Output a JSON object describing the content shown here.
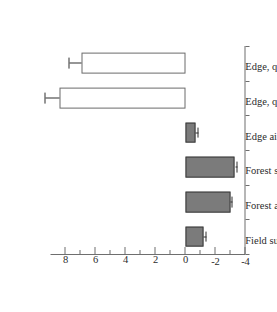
{
  "figure": {
    "rotation_note": "chart rendered rotated 90 degrees clockwise",
    "background_color": "#ffffff",
    "bar_fill_color": "#7b7b7b",
    "bar_open_color": "#ffffff",
    "axis_color": "#6e6e6e"
  },
  "chart_data": {
    "type": "bar",
    "title": "",
    "xlabel": "",
    "ylabel": "Temperature (°C)",
    "categories": [
      "Edge, qamaniq shade",
      "Edge, qamaniq sun",
      "Edge air",
      "Forest surface",
      "Forest air",
      "Field surface"
    ],
    "values": [
      6.9,
      8.4,
      -0.65,
      -3.3,
      -3.0,
      -1.2
    ],
    "errors": [
      0.85,
      0.9,
      0.2,
      0.18,
      0.12,
      0.2
    ],
    "bar_styles": [
      "open",
      "open",
      "filled",
      "filled",
      "filled",
      "filled"
    ],
    "ylim": [
      -4,
      9
    ],
    "ytick_labels": [
      "-4",
      "-2",
      "0",
      "2",
      "4",
      "6",
      "8"
    ],
    "ytick_values": [
      -4,
      -2,
      0,
      2,
      4,
      6,
      8
    ],
    "yminor_values": [
      -3,
      -1,
      1,
      3,
      5,
      7
    ],
    "grid": false,
    "legend": null,
    "axis_orientation": "value axis on right, category axis on top, bars drawn downward for positive values"
  }
}
